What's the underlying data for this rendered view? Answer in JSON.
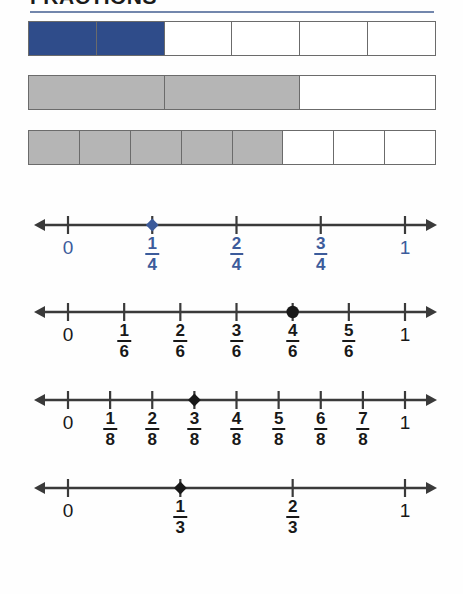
{
  "header": {
    "title": "FRACTIONS",
    "rule_color": "#7286ac"
  },
  "colors": {
    "blue_fill": "#2f4c8a",
    "gray_fill": "#b5b5b5",
    "blue_text": "#3c5b9b",
    "dark_text": "#181818",
    "line_stroke": "#3a3a3a",
    "bar_stroke": "#6b6b6b"
  },
  "fraction_bars": [
    {
      "name": "bar-sixths",
      "total_parts": 6,
      "shaded_parts": 2,
      "fill": "blue",
      "fraction_label": "2/6"
    },
    {
      "name": "bar-thirds",
      "total_parts": 3,
      "shaded_parts": 2,
      "fill": "gray",
      "fraction_label": "2/3"
    },
    {
      "name": "bar-eighths",
      "total_parts": 8,
      "shaded_parts": 5,
      "fill": "gray",
      "fraction_label": "5/8"
    }
  ],
  "number_lines": [
    {
      "name": "numberline-fourths",
      "denominator": 4,
      "start_label": "0",
      "end_label": "1",
      "label_color": "blue",
      "marker": {
        "value": "1/4",
        "numerator": 1,
        "color": "#3c5b9b",
        "shape": "diamond"
      },
      "ticks": [
        {
          "label": "0",
          "numerator": 0,
          "type": "whole"
        },
        {
          "label": "1/4",
          "numerator": 1,
          "type": "fraction",
          "num": "1",
          "den": "4"
        },
        {
          "label": "2/4",
          "numerator": 2,
          "type": "fraction",
          "num": "2",
          "den": "4"
        },
        {
          "label": "3/4",
          "numerator": 3,
          "type": "fraction",
          "num": "3",
          "den": "4"
        },
        {
          "label": "1",
          "numerator": 4,
          "type": "whole"
        }
      ]
    },
    {
      "name": "numberline-sixths",
      "denominator": 6,
      "start_label": "0",
      "end_label": "1",
      "label_color": "dark",
      "marker": {
        "value": "4/6",
        "numerator": 4,
        "color": "#181818",
        "shape": "dot"
      },
      "ticks": [
        {
          "label": "0",
          "numerator": 0,
          "type": "whole"
        },
        {
          "label": "1/6",
          "numerator": 1,
          "type": "fraction",
          "num": "1",
          "den": "6"
        },
        {
          "label": "2/6",
          "numerator": 2,
          "type": "fraction",
          "num": "2",
          "den": "6"
        },
        {
          "label": "3/6",
          "numerator": 3,
          "type": "fraction",
          "num": "3",
          "den": "6"
        },
        {
          "label": "4/6",
          "numerator": 4,
          "type": "fraction",
          "num": "4",
          "den": "6"
        },
        {
          "label": "5/6",
          "numerator": 5,
          "type": "fraction",
          "num": "5",
          "den": "6"
        },
        {
          "label": "1",
          "numerator": 6,
          "type": "whole"
        }
      ]
    },
    {
      "name": "numberline-eighths",
      "denominator": 8,
      "start_label": "0",
      "end_label": "1",
      "label_color": "dark",
      "marker": {
        "value": "3/8",
        "numerator": 3,
        "color": "#181818",
        "shape": "diamond"
      },
      "ticks": [
        {
          "label": "0",
          "numerator": 0,
          "type": "whole"
        },
        {
          "label": "1/8",
          "numerator": 1,
          "type": "fraction",
          "num": "1",
          "den": "8"
        },
        {
          "label": "2/8",
          "numerator": 2,
          "type": "fraction",
          "num": "2",
          "den": "8"
        },
        {
          "label": "3/8",
          "numerator": 3,
          "type": "fraction",
          "num": "3",
          "den": "8"
        },
        {
          "label": "4/8",
          "numerator": 4,
          "type": "fraction",
          "num": "4",
          "den": "8"
        },
        {
          "label": "5/8",
          "numerator": 5,
          "type": "fraction",
          "num": "5",
          "den": "8"
        },
        {
          "label": "6/8",
          "numerator": 6,
          "type": "fraction",
          "num": "6",
          "den": "8"
        },
        {
          "label": "7/8",
          "numerator": 7,
          "type": "fraction",
          "num": "7",
          "den": "8"
        },
        {
          "label": "1",
          "numerator": 8,
          "type": "whole"
        }
      ]
    },
    {
      "name": "numberline-thirds",
      "denominator": 3,
      "start_label": "0",
      "end_label": "1",
      "label_color": "dark",
      "marker": {
        "value": "1/3",
        "numerator": 1,
        "color": "#181818",
        "shape": "diamond"
      },
      "ticks": [
        {
          "label": "0",
          "numerator": 0,
          "type": "whole"
        },
        {
          "label": "1/3",
          "numerator": 1,
          "type": "fraction",
          "num": "1",
          "den": "3"
        },
        {
          "label": "2/3",
          "numerator": 2,
          "type": "fraction",
          "num": "2",
          "den": "3"
        },
        {
          "label": "1",
          "numerator": 3,
          "type": "whole"
        }
      ]
    }
  ],
  "geometry": {
    "tick_left_x": 68,
    "tick_right_x": 405,
    "arrow_left_x": 34,
    "arrow_right_x": 437,
    "axis_y": 20
  }
}
